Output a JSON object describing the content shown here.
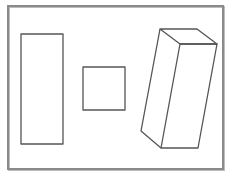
{
  "diagram": {
    "frame_color": "#8a8a8a",
    "stroke_color": "#555555",
    "shapes": [
      {
        "name": "tall-rectangle",
        "type": "rect",
        "x": 21,
        "y": 34,
        "width": 42,
        "height": 110
      },
      {
        "name": "square",
        "type": "rect",
        "x": 83,
        "y": 67,
        "width": 42,
        "height": 43
      },
      {
        "name": "rectangular-prism",
        "type": "prism",
        "top_face": [
          [
            160,
            29
          ],
          [
            197,
            29
          ],
          [
            217,
            44
          ],
          [
            180,
            44
          ]
        ],
        "front_face": [
          [
            180,
            44
          ],
          [
            217,
            44
          ],
          [
            198,
            148
          ],
          [
            161,
            148
          ]
        ],
        "side_edge": [
          [
            160,
            29
          ],
          [
            141,
            131
          ],
          [
            161,
            148
          ]
        ]
      }
    ]
  }
}
